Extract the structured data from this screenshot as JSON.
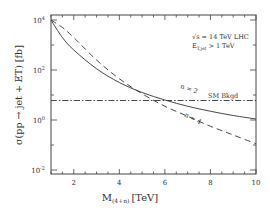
{
  "chart_data": {
    "type": "line",
    "title": "",
    "xlabel": "M",
    "xlabel_sub": "(4+n)",
    "xlabel_unit": "[TeV]",
    "ylabel": "σ(pp → jet + E̸T) [fb]",
    "xlim": [
      1,
      10
    ],
    "ylim_log10": [
      -2.16,
      4.2
    ],
    "yscale": "log",
    "grid": false,
    "x_ticks": [
      2,
      4,
      6,
      8,
      10
    ],
    "x_tick_labels": [
      "2",
      "4",
      "6",
      "8",
      "10"
    ],
    "y_ticks_log10": [
      -2,
      0,
      2,
      4
    ],
    "y_tick_labels": [
      "10",
      "10",
      "10",
      "10"
    ],
    "y_tick_exponents": [
      "-2",
      "0",
      "2",
      "4"
    ],
    "annotations": {
      "line1": "√s = 14 TeV LHC",
      "line2_main": "E",
      "line2_sub": "T,jet",
      "line2_rest": "> 1 TeV",
      "sm_label": "SM Bkgd",
      "n2_label": "n = 2",
      "n4_label": "n = 4"
    },
    "series": [
      {
        "name": "n = 2",
        "style": "solid",
        "x": [
          1,
          1.5,
          2,
          3,
          4,
          5,
          6,
          7,
          8,
          9,
          10
        ],
        "y_log10": [
          4.0,
          3.3,
          2.8,
          2.05,
          1.5,
          1.1,
          0.8,
          0.55,
          0.35,
          0.18,
          0.04
        ]
      },
      {
        "name": "n = 4",
        "style": "dashed",
        "x": [
          1,
          1.5,
          2,
          3,
          4,
          5,
          6,
          7,
          8,
          9,
          10
        ],
        "y_log10": [
          4.0,
          3.7,
          3.3,
          2.4,
          1.65,
          1.05,
          0.55,
          0.15,
          -0.25,
          -0.6,
          -0.95
        ]
      },
      {
        "name": "SM Bkgd",
        "style": "dash-dot",
        "x": [
          1,
          10
        ],
        "y_log10": [
          0.78,
          0.78
        ]
      }
    ]
  }
}
